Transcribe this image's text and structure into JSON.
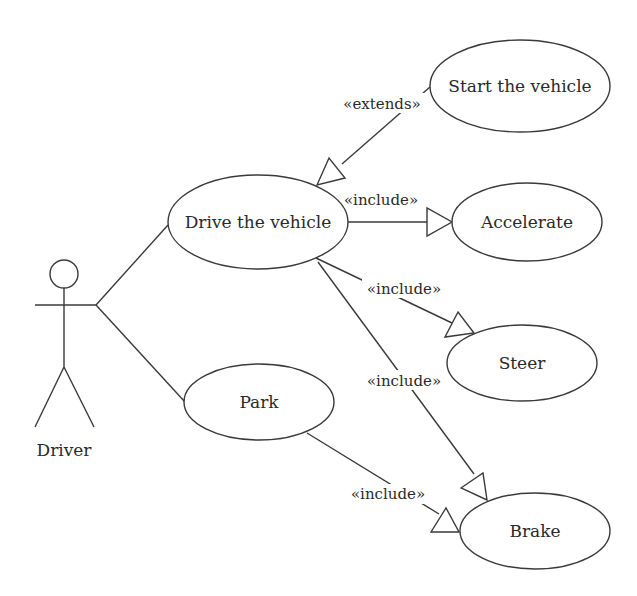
{
  "diagram": {
    "type": "UML use case diagram",
    "actor": {
      "label": "Driver"
    },
    "use_cases": {
      "start": "Start the vehicle",
      "drive": "Drive the vehicle",
      "accelerate": "Accelerate",
      "steer": "Steer",
      "park": "Park",
      "brake": "Brake"
    },
    "relationships": [
      {
        "from": "Driver",
        "to": "Drive the vehicle",
        "type": "association",
        "label": ""
      },
      {
        "from": "Driver",
        "to": "Park",
        "type": "association",
        "label": ""
      },
      {
        "from": "Start the vehicle",
        "to": "Drive the vehicle",
        "type": "extends",
        "label": "«extends»"
      },
      {
        "from": "Drive the vehicle",
        "to": "Accelerate",
        "type": "include",
        "label": "«include»"
      },
      {
        "from": "Drive the vehicle",
        "to": "Steer",
        "type": "include",
        "label": "«include»"
      },
      {
        "from": "Drive the vehicle",
        "to": "Brake",
        "type": "include",
        "label": "«include»"
      },
      {
        "from": "Park",
        "to": "Brake",
        "type": "include",
        "label": "«include»"
      }
    ],
    "stereotypes": {
      "extends": "«extends»",
      "include_accelerate": "«include»",
      "include_steer": "«include»",
      "include_brake_drive": "«include»",
      "include_brake_park": "«include»"
    }
  }
}
